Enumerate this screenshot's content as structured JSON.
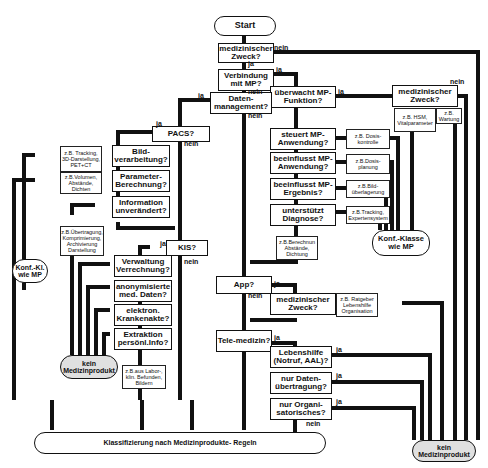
{
  "diagram": {
    "start": "Start",
    "decisions": {
      "med_zweck": "medizinischer Zweck?",
      "verbindung": "Verbindung mit MP?",
      "ueberwacht": "überwacht MP-Funktion?",
      "med_zweck2": "medizinischer Zweck?",
      "datenmgmt": "Daten-management?",
      "steuert": "steuert MP-Anwendung?",
      "beeinflusst_anw": "beeinflusst MP-Anwendung?",
      "beeinflusst_erg": "beeinflusst MP-Ergebnis?",
      "diagnose": "unterstützt Diagnose?",
      "pacs": "PACS?",
      "bild": "Bild-verarbeitung?",
      "parameter": "Parameter-Berechnung?",
      "info": "Information unverändert?",
      "kis": "KIS?",
      "verwaltung": "Verwaltung Verrechnung?",
      "anonym": "anonymisierte med. Daten?",
      "akte": "elektron. Krankenakte?",
      "extraktion": "Extraktion persönl.Info?",
      "app": "App?",
      "med_zweck3": "medizinischer Zweck?",
      "telemedizin": "Tele-medizin?",
      "lebenshilfe": "Lebenshilfe (Notruf, AAL)?",
      "datenuebertragung": "nur Daten-übertragung?",
      "organisatorisch": "nur Organi-satorisches?"
    },
    "examples": {
      "hsm": "z.B. HSM, Vitalparameter",
      "wartung": "z.B. Wartung",
      "dosiskontrolle": "z.B. Dosis-kontrolle",
      "dosisplanung": "z.B.Dosis-planung",
      "bildueberlagerung": "z.B.Bild-überlagerung",
      "tracking_exp": "z.B.Tracking, Expertensystem",
      "berechnung": "z.B.Berechnun Abstände, Dichtung",
      "tracking_3d": "z.B. Tracking, 3D-Darstellung, PET+CT",
      "volumen": "z.B.Volumen, Abstände, Dichten",
      "uebertragung": "z.B.Übertragung, Komprimierung, Archivierung Darstellung",
      "labor": "z.B.aus Labor-, klin. Befunden, Bildern",
      "ratgeber": "z.B. Ratgeber Lebenshilfe Organisation"
    },
    "terminals": {
      "konf_left": "Konf.-Kl. wie MP",
      "konf_right": "Konf.-Klasse wie MP",
      "kein_left": "kein Medizinprodukt",
      "kein_right": "kein Medizinprodukt",
      "klassifizierung": "Klassifizierung nach Medizinprodukte- Regeln"
    },
    "edge_labels": {
      "yes": "ja",
      "no": "nein"
    }
  }
}
